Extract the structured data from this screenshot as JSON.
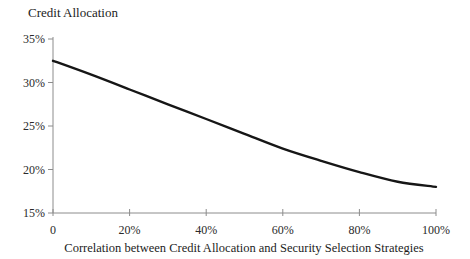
{
  "chart_data": {
    "type": "line",
    "title": "Credit Allocation",
    "xlabel": "Correlation between Credit Allocation and Security Selection Strategies",
    "ylabel": "",
    "series": [
      {
        "name": "Credit allocation vs correlation",
        "x": [
          0,
          10,
          20,
          30,
          40,
          50,
          60,
          70,
          80,
          90,
          100
        ],
        "values": [
          32.5,
          30.9,
          29.2,
          27.5,
          25.8,
          24.1,
          22.4,
          21.0,
          19.7,
          18.6,
          18.0
        ]
      }
    ],
    "xlim": [
      0,
      100
    ],
    "ylim": [
      15,
      35
    ],
    "x_ticks": [
      {
        "value": 0,
        "label": "0"
      },
      {
        "value": 20,
        "label": "20%"
      },
      {
        "value": 40,
        "label": "40%"
      },
      {
        "value": 60,
        "label": "60%"
      },
      {
        "value": 80,
        "label": "80%"
      },
      {
        "value": 100,
        "label": "100%"
      }
    ],
    "y_ticks": [
      {
        "value": 15,
        "label": "15%"
      },
      {
        "value": 20,
        "label": "20%"
      },
      {
        "value": 25,
        "label": "25%"
      },
      {
        "value": 30,
        "label": "30%"
      },
      {
        "value": 35,
        "label": "35%"
      }
    ],
    "grid": false,
    "legend": "none",
    "line_color": "#161616",
    "axis_color": "#8c8c8c"
  }
}
